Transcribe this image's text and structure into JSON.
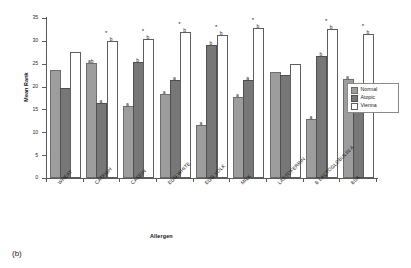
{
  "figure": {
    "caption": "(b)"
  },
  "chart_data": {
    "type": "bar",
    "title": "",
    "xlabel": "Allergen",
    "ylabel": "Mean Rank",
    "ylim": [
      0,
      35
    ],
    "ytick_values": [
      0,
      5,
      10,
      15,
      20,
      25,
      30,
      35
    ],
    "ytick_labels": [
      "0",
      "5",
      "10",
      "15",
      "20",
      "25",
      "30",
      "35"
    ],
    "grid": false,
    "legend_position": "right",
    "categories": [
      "WHEAT",
      "CATFISH",
      "CASEIN",
      "EGG WHITE",
      "EGG YOLK",
      "MILK",
      "LACTOFERRIN",
      "B LACTOGLOBULIN A",
      "BSA"
    ],
    "series": [
      {
        "name": "Normal",
        "color": "#9d9d9d",
        "values": [
          23.2,
          24.7,
          15.4,
          18.0,
          11.2,
          17.3,
          22.7,
          12.4,
          21.2
        ],
        "annotations": [
          "",
          "ab",
          "a",
          "a",
          "a",
          "a",
          "",
          "a",
          "a"
        ]
      },
      {
        "name": "Atopic",
        "color": "#777777",
        "values": [
          19.3,
          16.0,
          25.0,
          21.0,
          28.6,
          21.1,
          22.1,
          26.3,
          18.5
        ],
        "annotations": [
          "",
          "a",
          "b",
          "a",
          "b",
          "a",
          "",
          "b",
          "a"
        ]
      },
      {
        "name": "Vienna",
        "color": "#ffffff",
        "values": [
          27.2,
          29.5,
          30.0,
          31.4,
          30.8,
          32.3,
          24.5,
          32.2,
          31.0
        ],
        "annotations": [
          "",
          "b",
          "b",
          "b",
          "b",
          "b",
          "",
          "b",
          "b"
        ]
      }
    ],
    "significance_markers": {
      "symbol": "*",
      "groups": [
        "CATFISH",
        "CASEIN",
        "EGG WHITE",
        "EGG YOLK",
        "MILK",
        "B LACTOGLOBULIN A",
        "BSA"
      ]
    }
  },
  "legend": {
    "items": [
      {
        "label": "Normal",
        "swatch": "normal"
      },
      {
        "label": "Atopic",
        "swatch": "atopic"
      },
      {
        "label": "Vienna",
        "swatch": "vienna"
      }
    ]
  }
}
